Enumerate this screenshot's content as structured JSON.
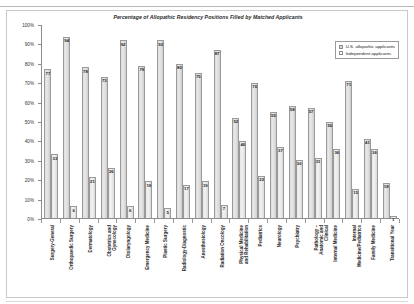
{
  "chart_data": {
    "type": "bar",
    "title": "Percentage of Allopathic Residency Positions Filled by Matched Applicants",
    "xlabel": "",
    "ylabel": "",
    "ylim": [
      0,
      100
    ],
    "ytick_labels": [
      "100%",
      "90%",
      "80%",
      "70%",
      "60%",
      "50%",
      "40%",
      "30%",
      "20%",
      "10%",
      "0%"
    ],
    "ytick_values": [
      100,
      90,
      80,
      70,
      60,
      50,
      40,
      30,
      20,
      10,
      0
    ],
    "grid": false,
    "legend_position": "top-right",
    "categories": [
      "Surgery-General",
      "Orthopaedic Surgery",
      "Dermatology",
      "Obstetrics and Gynecology",
      "Otolaryngology",
      "Emergency Medicine",
      "Plastic Surgery",
      "Radiology-Diagnostic",
      "Anesthesiology",
      "Radiation Oncology",
      "Physical Medicine and Rehabilitation",
      "Pediatrics",
      "Neurology",
      "Psychiatry",
      "Pathology – Anatomic and Clinical",
      "Internal Medicine",
      "Internal Medicine/Pediatrics",
      "Family Medicine",
      "Transitional Year"
    ],
    "series": [
      {
        "name": "U.S. allopathic applicants",
        "color": "#d9d9d9",
        "values": [
          77,
          94,
          78,
          73,
          92,
          79,
          92,
          80,
          75,
          87,
          52,
          70,
          55,
          58,
          57,
          50,
          71,
          41,
          18
        ]
      },
      {
        "name": "Independent applicants",
        "color": "#ffffff",
        "values": [
          33,
          6,
          21,
          26,
          6,
          19,
          5,
          17,
          19,
          7,
          40,
          22,
          37,
          30,
          31,
          36,
          15,
          36,
          1
        ]
      }
    ]
  },
  "legend": {
    "items": [
      {
        "label": "U.S. allopathic applicants"
      },
      {
        "label": "Independent applicants"
      }
    ]
  }
}
